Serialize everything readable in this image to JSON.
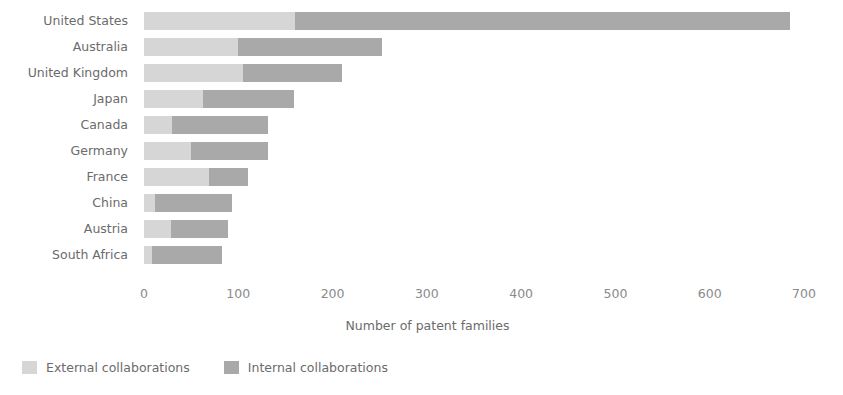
{
  "chart_data": {
    "type": "bar",
    "orientation": "horizontal",
    "stacked": true,
    "title": "",
    "xlabel": "Number of patent families",
    "ylabel": "",
    "xlim": [
      0,
      700
    ],
    "xticks": [
      0,
      100,
      200,
      300,
      400,
      500,
      600,
      700
    ],
    "xtick_labels": [
      "0",
      "100",
      "200",
      "300",
      "400",
      "500",
      "600",
      "700"
    ],
    "grid": false,
    "legend_position": "bottom-left",
    "categories": [
      "United States",
      "Australia",
      "United Kingdom",
      "Japan",
      "Canada",
      "Germany",
      "France",
      "China",
      "Austria",
      "South Africa"
    ],
    "series": [
      {
        "name": "External collaborations",
        "color": "#d6d6d6",
        "values": [
          160,
          100,
          105,
          63,
          30,
          50,
          69,
          12,
          29,
          8
        ]
      },
      {
        "name": "Internal collaborations",
        "color": "#a9a9a9",
        "values": [
          525,
          152,
          105,
          96,
          101,
          81,
          41,
          81,
          60,
          75
        ]
      }
    ],
    "totals": [
      685,
      252,
      210,
      159,
      131,
      131,
      110,
      93,
      89,
      83
    ]
  },
  "axis": {
    "x_title": "Number of patent families"
  },
  "legend": {
    "items": [
      {
        "label": "External collaborations",
        "color": "#d6d6d6",
        "swatch": "legend-swatch-external"
      },
      {
        "label": "Internal collaborations",
        "color": "#a9a9a9",
        "swatch": "legend-swatch-internal"
      }
    ]
  },
  "colors": {
    "external": "#d6d6d6",
    "internal": "#a9a9a9",
    "text": "#6b6b6b",
    "tick_text": "#8a8a8a",
    "background": "#ffffff"
  }
}
